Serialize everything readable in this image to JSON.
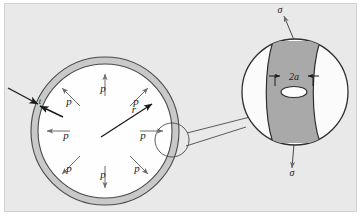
{
  "figure": {
    "panel_background": "#e9e9e9",
    "shell_fill": "#c9c9c9",
    "interior_fill": "#fefefe",
    "band_fill": "#a9a9a9",
    "detail_fill": "#fbfbfb",
    "line_color": "#3a3a3a",
    "arrow_color": "#6e6e6e"
  },
  "main_sphere": {
    "center": {
      "x": 105,
      "y": 131
    },
    "outer_radius": 74,
    "inner_radius": 67,
    "radius_label": "r",
    "thickness_label": "t",
    "pressure_label": "p",
    "pressure_arrows": [
      {
        "id": "p-top",
        "label": "p",
        "angle_deg": 90,
        "label_x": 103,
        "label_y": 92
      },
      {
        "id": "p-upper-left",
        "label": "p",
        "angle_deg": 135,
        "label_x": 69,
        "label_y": 105
      },
      {
        "id": "p-upper-right",
        "label": "p",
        "angle_deg": 45,
        "label_x": 136,
        "label_y": 105
      },
      {
        "id": "p-left",
        "label": "p",
        "angle_deg": 180,
        "label_x": 66,
        "label_y": 139
      },
      {
        "id": "p-right",
        "label": "p",
        "angle_deg": 0,
        "label_x": 143,
        "label_y": 139
      },
      {
        "id": "p-lower-left",
        "label": "p",
        "angle_deg": 225,
        "label_x": 69,
        "label_y": 172
      },
      {
        "id": "p-lower-right",
        "label": "p",
        "angle_deg": 315,
        "label_x": 137,
        "label_y": 172
      },
      {
        "id": "p-bottom",
        "label": "p",
        "angle_deg": 270,
        "label_x": 103,
        "label_y": 178
      }
    ]
  },
  "detail_marker": {
    "center": {
      "x": 172,
      "y": 140
    },
    "radius": 17
  },
  "detail_view": {
    "center": {
      "x": 295,
      "y": 92
    },
    "radius": 53,
    "crack_width_label": "2a",
    "stress_label_top": "σ",
    "stress_label_bottom": "σ",
    "hole": {
      "cx": 294,
      "cy": 92,
      "rx": 13,
      "ry": 5.5
    }
  }
}
